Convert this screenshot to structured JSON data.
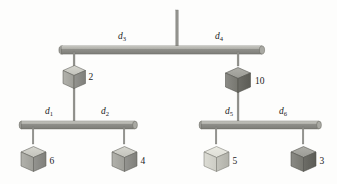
{
  "figure": {
    "background_color": "#fdfdfc"
  },
  "colors": {
    "bar_top": "#b9b9b4",
    "bar_front": "#8f8f8a",
    "bar_edge": "#6e6e69",
    "rod": "#8c8c88",
    "cube_top": "#cfcfc8",
    "cube_left": "#a8a8a2",
    "cube_right": "#8a8a84",
    "cube_outline": "#5c5c57",
    "text": "#1c1c1c"
  },
  "ceiling_support": {
    "name": "ceiling-rod",
    "x": 177,
    "y_top": 10,
    "y_bottom": 48
  },
  "beams": [
    {
      "id": "top-beam",
      "x1": 60,
      "x2": 263,
      "y": 48,
      "pivot_x": 177,
      "labels": [
        {
          "base": "d",
          "sub": "3",
          "x": 120,
          "y": 38
        },
        {
          "base": "d",
          "sub": "4",
          "x": 218,
          "y": 38
        }
      ]
    },
    {
      "id": "left-beam",
      "x1": 20,
      "x2": 136,
      "y": 123,
      "pivot_x": 74,
      "labels": [
        {
          "base": "d",
          "sub": "1",
          "x": 48,
          "y": 113
        },
        {
          "base": "d",
          "sub": "2",
          "x": 104,
          "y": 113
        }
      ]
    },
    {
      "id": "right-beam",
      "x1": 200,
      "x2": 320,
      "y": 123,
      "pivot_x": 238,
      "labels": [
        {
          "base": "d",
          "sub": "5",
          "x": 228,
          "y": 113
        },
        {
          "base": "d",
          "sub": "6",
          "x": 282,
          "y": 113
        }
      ]
    }
  ],
  "blocks": [
    {
      "id": "block-2",
      "label": "2",
      "cx": 74,
      "cy": 75,
      "size": 22,
      "shade": "medium",
      "hangs_from": "top-beam",
      "supports": "left-beam",
      "label_x": 92,
      "label_y": 79
    },
    {
      "id": "block-10",
      "label": "10",
      "cx": 238,
      "cy": 78,
      "size": 24,
      "shade": "dark",
      "hangs_from": "top-beam",
      "supports": "right-beam",
      "label_x": 259,
      "label_y": 82
    },
    {
      "id": "block-6",
      "label": "6",
      "cx": 33,
      "cy": 157,
      "size": 24,
      "shade": "medium",
      "hangs_from": "left-beam",
      "label_x": 54,
      "label_y": 162
    },
    {
      "id": "block-4",
      "label": "4",
      "cx": 124,
      "cy": 157,
      "size": 24,
      "shade": "medium",
      "hangs_from": "left-beam",
      "label_x": 145,
      "label_y": 162
    },
    {
      "id": "block-5",
      "label": "5",
      "cx": 216,
      "cy": 157,
      "size": 24,
      "shade": "light",
      "hangs_from": "right-beam",
      "label_x": 237,
      "label_y": 162
    },
    {
      "id": "block-3",
      "label": "3",
      "cx": 303,
      "cy": 157,
      "size": 24,
      "shade": "dark",
      "hangs_from": "right-beam",
      "label_x": 323,
      "label_y": 162
    }
  ],
  "distance_labels": [
    "d1",
    "d2",
    "d3",
    "d4",
    "d5",
    "d6"
  ],
  "weight_labels": [
    "2",
    "10",
    "6",
    "4",
    "5",
    "3"
  ]
}
